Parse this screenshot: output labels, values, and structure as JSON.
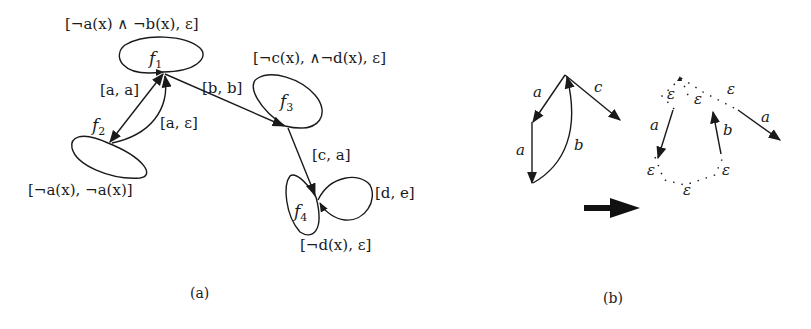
{
  "figure": {
    "panel_a": {
      "caption": "(a)",
      "nodes": [
        {
          "id": "f1",
          "label": "f",
          "sub": "1",
          "guard_label": "[¬a(x) ∧ ¬b(x), ε]"
        },
        {
          "id": "f2",
          "label": "f",
          "sub": "2",
          "guard_label": "[¬a(x), ¬a(x)]"
        },
        {
          "id": "f3",
          "label": "f",
          "sub": "3",
          "guard_label": "[¬c(x), ∧¬d(x), ε]"
        },
        {
          "id": "f4",
          "label": "f",
          "sub": "4",
          "guard_label": "[¬d(x), ε]"
        }
      ],
      "edges": [
        {
          "from": "f1",
          "to": "f2",
          "label": "[a, a]"
        },
        {
          "from": "f2",
          "to": "f1",
          "label": "[a, ε]"
        },
        {
          "from": "f1",
          "to": "f3",
          "label": "[b, b]"
        },
        {
          "from": "f3",
          "to": "f4",
          "label": "[c, a]"
        },
        {
          "from": "f4",
          "to": "f4",
          "label": "[d, e]"
        }
      ]
    },
    "panel_b": {
      "caption": "(b)",
      "left_graph": {
        "edges": [
          {
            "label": "a"
          },
          {
            "label": "c"
          },
          {
            "label": "a"
          },
          {
            "label": "b"
          }
        ]
      },
      "transform_arrow": "right-arrow",
      "right_graph": {
        "edge_labels": [
          "a",
          "b",
          "a"
        ],
        "epsilon_labels": [
          "ε",
          "ε",
          "ε",
          "ε",
          "ε",
          "ε"
        ]
      }
    }
  }
}
